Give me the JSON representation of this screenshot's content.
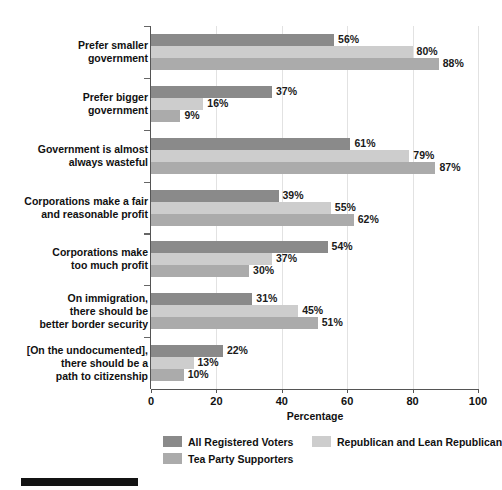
{
  "scan_residue_text": "",
  "chart_data": {
    "type": "bar",
    "orientation": "horizontal",
    "title": "",
    "xlabel": "Percentage",
    "ylabel": "",
    "xlim": [
      0,
      100
    ],
    "xticks": [
      0,
      20,
      40,
      60,
      80,
      100
    ],
    "xtick_labels": [
      "0",
      "20",
      "40",
      "60",
      "80",
      "100"
    ],
    "grid": "vertical",
    "legend_position": "bottom",
    "value_suffix": "%",
    "categories": [
      "Prefer smaller\ngovernment",
      "Prefer bigger\ngovernment",
      "Government is almost\nalways wasteful",
      "Corporations make a fair\nand reasonable profit",
      "Corporations make\ntoo much profit",
      "On immigration,\nthere should be\nbetter border security",
      "[On the undocumented],\nthere should be a\npath to citizenship"
    ],
    "category_lines": [
      [
        "Prefer smaller",
        "government"
      ],
      [
        "Prefer bigger",
        "government"
      ],
      [
        "Government is almost",
        "always wasteful"
      ],
      [
        "Corporations make a fair",
        "and reasonable profit"
      ],
      [
        "Corporations make",
        "too much profit"
      ],
      [
        "On immigration,",
        "there should be",
        "better border security"
      ],
      [
        "[On the undocumented],",
        "there should be a",
        "path to citizenship"
      ]
    ],
    "series": [
      {
        "name": "All Registered Voters",
        "color": "#8a8a8a",
        "values": [
          56,
          37,
          61,
          39,
          54,
          31,
          22
        ],
        "labels": [
          "56%",
          "37%",
          "61%",
          "39%",
          "54%",
          "31%",
          "22%"
        ]
      },
      {
        "name": "Republican and Lean Republican",
        "color": "#cdcdcd",
        "values": [
          80,
          16,
          79,
          55,
          37,
          45,
          13
        ],
        "labels": [
          "80%",
          "16%",
          "79%",
          "55%",
          "37%",
          "45%",
          "13%"
        ]
      },
      {
        "name": "Tea Party Supporters",
        "color": "#ababab",
        "values": [
          88,
          9,
          87,
          62,
          30,
          51,
          10
        ],
        "labels": [
          "88%",
          "9%",
          "87%",
          "62%",
          "30%",
          "51%",
          "10%"
        ]
      }
    ]
  },
  "legend": {
    "entries": [
      {
        "label": "All Registered Voters",
        "color": "#8a8a8a"
      },
      {
        "label": "Republican and Lean Republican",
        "color": "#cdcdcd"
      },
      {
        "label": "Tea Party Supporters",
        "color": "#ababab"
      }
    ]
  },
  "axis": {
    "x_title": "Percentage"
  },
  "colors": {
    "axis": "#555555",
    "grid": "#e2e2e2",
    "text": "#111111",
    "rule": "#131313"
  }
}
